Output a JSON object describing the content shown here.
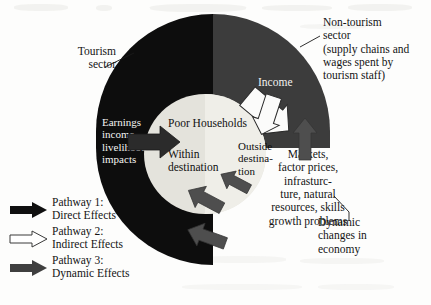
{
  "figure": {
    "type": "diagram"
  },
  "circle": {
    "tourism_sector_color": "#0d0d0d",
    "nontourism_sector_color": "#3c3c3c",
    "inner_circle_color": "#e4e3dc"
  },
  "labels": {
    "tourism_sector": "Tourism\nsector",
    "nontourism_sector": "Non-tourism\nsector\n(supply chains and\nwages spent by\ntourism staff)",
    "earnings": "Earnings\nincome,\nlivelihood\nimpacts",
    "poor_households": "Poor Households",
    "within_destination": "Within\ndestination",
    "outside_destination": "Outside\ndestina-\ntion",
    "income": "Income",
    "markets": "Markets,\nfactor prices,\ninfrasturc-\nture, natural\nresources, skills\ngrowth problems",
    "dynamic_changes": "Dynamic\nchanges in\neconomy"
  },
  "legend": {
    "items": [
      {
        "label": "Pathway 1:\nDirect Effects",
        "style": "solid-black",
        "color": "#101010"
      },
      {
        "label": "Pathway 2:\nIndirect Effects",
        "style": "outline-white",
        "color": "#ffffff"
      },
      {
        "label": "Pathway 3:\nDynamic Effects",
        "style": "solid-gray",
        "color": "#4a4a4a"
      }
    ]
  },
  "arrows": {
    "direct_effect_into_center": "black arrow pointing right into Poor Households",
    "indirect_income_1": "white outline arrow pointing down-left into inner circle",
    "indirect_income_2": "white outline arrow pointing down-left into inner circle",
    "dynamic_up": "gray arrow pointing up into non-tourism sector",
    "dynamic_in_1": "gray arrow pointing up-left into inner circle",
    "dynamic_in_2": "gray arrow pointing up-left into inner circle",
    "dynamic_in_3": "gray arrow pointing up-left into tourism sector"
  }
}
